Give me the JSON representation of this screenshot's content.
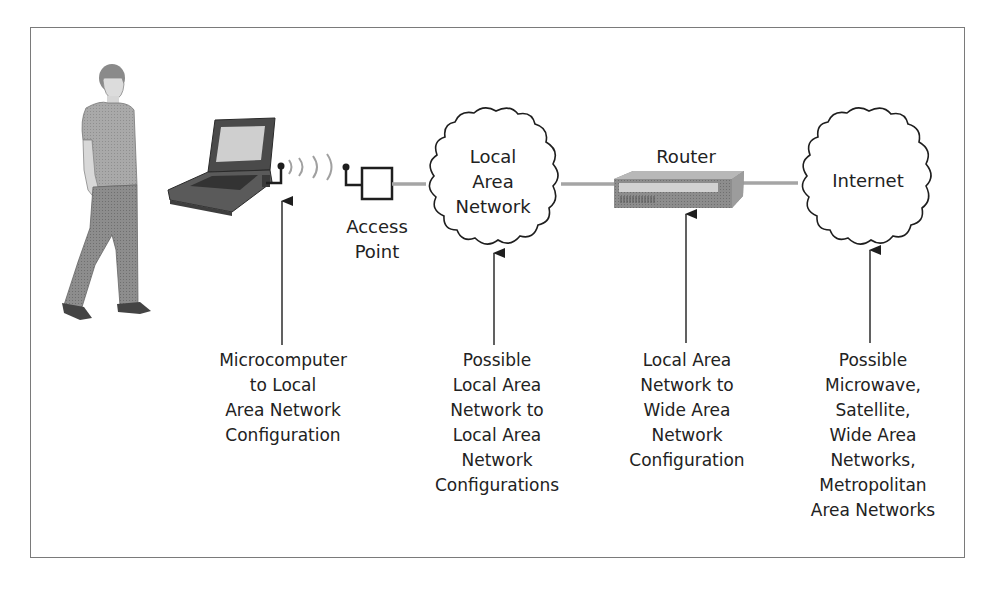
{
  "diagram": {
    "title": "",
    "nodes": [
      {
        "id": "user",
        "label": "",
        "icon": "person-icon"
      },
      {
        "id": "laptop",
        "label": "",
        "icon": "laptop-icon"
      },
      {
        "id": "access_point",
        "label_lines": [
          "Access",
          "Point"
        ],
        "icon": "access-point-icon"
      },
      {
        "id": "lan",
        "label_lines": [
          "Local",
          "Area",
          "Network"
        ],
        "icon": "cloud-icon"
      },
      {
        "id": "router",
        "label_lines": [
          "Router"
        ],
        "icon": "router-icon"
      },
      {
        "id": "internet",
        "label_lines": [
          "Internet"
        ],
        "icon": "cloud-icon"
      }
    ],
    "edges": [
      {
        "from": "laptop",
        "to": "access_point",
        "type": "wireless"
      },
      {
        "from": "access_point",
        "to": "lan",
        "type": "wired"
      },
      {
        "from": "lan",
        "to": "router",
        "type": "wired"
      },
      {
        "from": "router",
        "to": "internet",
        "type": "wired"
      }
    ],
    "annotations": [
      {
        "target": "laptop",
        "lines": [
          "Microcomputer",
          "to Local",
          "Area Network",
          "Configuration"
        ]
      },
      {
        "target": "lan",
        "lines": [
          "Possible",
          "Local Area",
          "Network to",
          "Local Area",
          "Network",
          "Configurations"
        ]
      },
      {
        "target": "router",
        "lines": [
          "Local Area",
          "Network to",
          "Wide Area",
          "Network",
          "Configuration"
        ]
      },
      {
        "target": "internet",
        "lines": [
          "Possible",
          "Microwave,",
          "Satellite,",
          "Wide Area",
          "Networks,",
          "Metropolitan",
          "Area Networks"
        ]
      }
    ]
  },
  "colors": {
    "frame": "#7a7a7a",
    "line_gray": "#9a9a9a",
    "stroke_dark": "#1e1e1e",
    "router_body": "#8a8a8a",
    "router_top": "#b5b5b5",
    "router_panel": "#d0d0d0"
  }
}
